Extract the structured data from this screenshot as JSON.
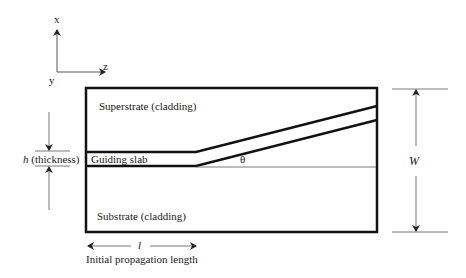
{
  "diagram": {
    "axes": {
      "x_label": "x",
      "y_label": "y",
      "z_label": "z"
    },
    "regions": {
      "superstrate": "Superstrate (cladding)",
      "guiding_slab": "Guiding slab",
      "substrate": "Substrate (cladding)"
    },
    "dimensions": {
      "thickness_symbol": "h",
      "thickness_text": " (thickness)",
      "angle_symbol": "θ",
      "width_symbol": "W",
      "length_symbol": "l",
      "length_caption": "Initial propagation length"
    },
    "colors": {
      "line": "#111111",
      "thin_line": "#555555",
      "background": "#ffffff"
    }
  }
}
